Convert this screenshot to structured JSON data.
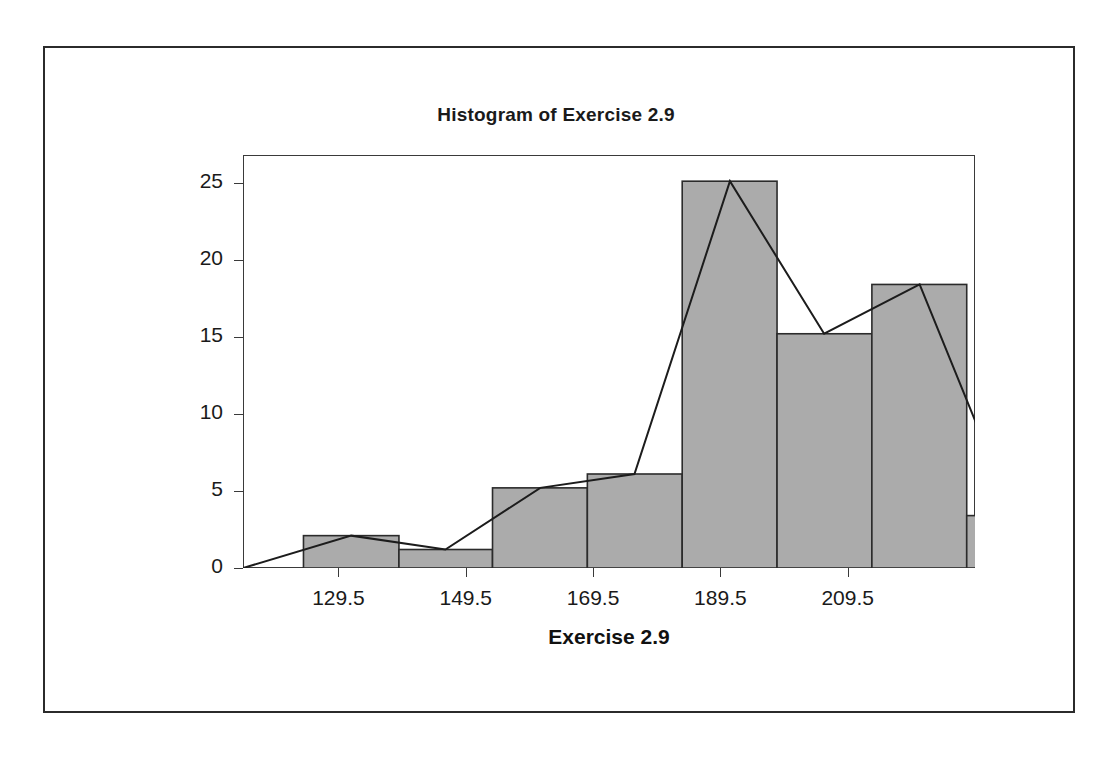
{
  "figure": {
    "title": "Histogram of Exercise 2.9",
    "xlabel": "Exercise 2.9",
    "ylabel": "Frequency",
    "bar_fill": "#ababab",
    "bar_stroke": "#2b2b2b",
    "polygon_stroke": "#1c1c1c",
    "frame_stroke": "#3a3a3a"
  },
  "chart_data": {
    "type": "bar",
    "title": "Histogram of Exercise 2.9",
    "xlabel": "Exercise 2.9",
    "ylabel": "Frequency",
    "grid": false,
    "legend": null,
    "xlim": [
      114.5,
      229.5
    ],
    "ylim": [
      0,
      26.8
    ],
    "bin_width": 15,
    "bin_edges": [
      119.5,
      134.5,
      149.5,
      164.5,
      179.5,
      194.5,
      209.5,
      224.5
    ],
    "x_tick_labels": [
      "129.5",
      "149.5",
      "169.5",
      "189.5",
      "209.5"
    ],
    "x_tick_values": [
      129.5,
      149.5,
      169.5,
      189.5,
      209.5
    ],
    "y_tick_labels": [
      "0",
      "5",
      "10",
      "15",
      "20",
      "25"
    ],
    "y_tick_values": [
      0,
      5,
      10,
      15,
      20,
      25
    ],
    "bars": [
      {
        "left": 124.0,
        "right": 139.0,
        "midpoint": 131.5,
        "value": 2.1
      },
      {
        "left": 139.0,
        "right": 153.7,
        "midpoint": 146.3,
        "value": 1.2
      },
      {
        "left": 153.7,
        "right": 168.6,
        "midpoint": 161.2,
        "value": 5.2
      },
      {
        "left": 168.6,
        "right": 183.5,
        "midpoint": 176.0,
        "value": 6.1
      },
      {
        "left": 183.5,
        "right": 198.4,
        "midpoint": 191.0,
        "value": 25.1
      },
      {
        "left": 198.4,
        "right": 213.3,
        "midpoint": 205.8,
        "value": 15.2
      },
      {
        "left": 213.3,
        "right": 228.2,
        "midpoint": 220.8,
        "value": 18.4
      },
      {
        "left": 228.2,
        "right": 243.1,
        "midpoint": 235.6,
        "value": 3.4
      },
      {
        "left": 243.1,
        "right": 258.0,
        "midpoint": 250.5,
        "value": 4.5
      },
      {
        "left": 258.0,
        "right": 272.9,
        "midpoint": 265.4,
        "value": 2.5
      }
    ],
    "polygon": {
      "name": "frequency polygon",
      "points": [
        {
          "x": 114.5,
          "y": 0
        },
        {
          "x": 131.5,
          "y": 2.1
        },
        {
          "x": 146.3,
          "y": 1.2
        },
        {
          "x": 161.2,
          "y": 5.2
        },
        {
          "x": 176.0,
          "y": 6.1
        },
        {
          "x": 191.0,
          "y": 25.1
        },
        {
          "x": 205.8,
          "y": 15.2
        },
        {
          "x": 220.8,
          "y": 18.4
        },
        {
          "x": 235.6,
          "y": 3.4
        },
        {
          "x": 250.5,
          "y": 4.5
        },
        {
          "x": 265.4,
          "y": 2.5
        },
        {
          "x": 229.5,
          "y": 0
        }
      ]
    }
  }
}
